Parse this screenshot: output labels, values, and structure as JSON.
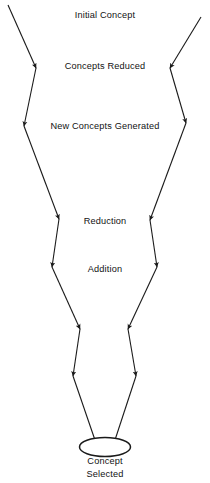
{
  "diagram": {
    "type": "converging-zigzag-flow",
    "stages": [
      {
        "id": "initial-concept",
        "label": "Initial Concept"
      },
      {
        "id": "concepts-reduced",
        "label": "Concepts Reduced"
      },
      {
        "id": "new-concepts-generated",
        "label": "New Concepts Generated"
      },
      {
        "id": "reduction",
        "label": "Reduction"
      },
      {
        "id": "addition",
        "label": "Addition"
      }
    ],
    "outcome": {
      "id": "concept-selected",
      "shape": "ellipse",
      "line1": "Concept",
      "line2": "Selected"
    },
    "colors": {
      "background": "#ffffff",
      "stroke": "#1a1a1a",
      "text": "#121212"
    },
    "paths": {
      "left": {
        "name": "left-funnel-path",
        "points": "8,5 36,68 24,126 59,219 52,267 80,329 73,376 96,443"
      },
      "right": {
        "name": "right-funnel-path",
        "points": "201,17 170,68 186,123 150,220 157,267 128,329 136,376 114,443"
      }
    },
    "arrow_count": 14
  }
}
